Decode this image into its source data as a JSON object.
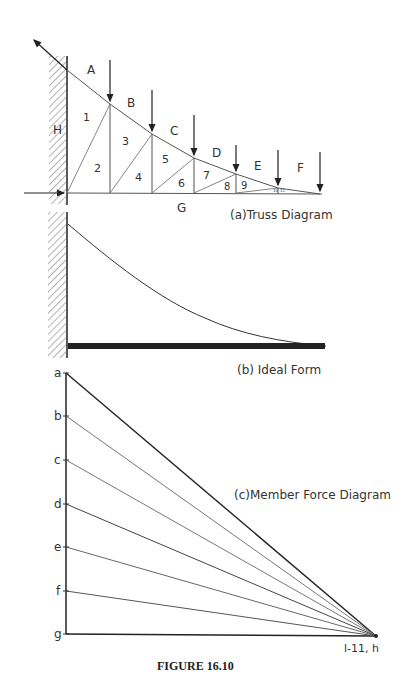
{
  "truss": {
    "caption": "(a)Truss Diagram",
    "space_labels": [
      "A",
      "B",
      "C",
      "D",
      "E",
      "F",
      "G",
      "H"
    ],
    "panel_labels": [
      "1",
      "2",
      "3",
      "4",
      "5",
      "6",
      "7",
      "8",
      "9",
      "10",
      "11"
    ]
  },
  "ideal": {
    "caption": "(b) Ideal Form"
  },
  "force": {
    "caption": "(c)Member Force Diagram",
    "load_line_labels": [
      "a",
      "b",
      "c",
      "d",
      "e",
      "f",
      "g"
    ],
    "pole_label": "l-11, h"
  },
  "figure_label": "FIGURE 16.10"
}
